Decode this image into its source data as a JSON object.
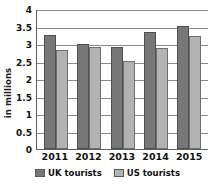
{
  "chart_data": {
    "type": "bar",
    "title": "",
    "subtitle": "",
    "xlabel": "",
    "ylabel": "in millions",
    "categories": [
      "2011",
      "2012",
      "2013",
      "2014",
      "2015"
    ],
    "series": [
      {
        "name": "UK tourists",
        "color": "#777777",
        "values": [
          3.26,
          3.0,
          2.92,
          3.33,
          3.52
        ]
      },
      {
        "name": "US tourists",
        "color": "#b3b3b3",
        "values": [
          2.83,
          2.92,
          2.51,
          2.89,
          3.22
        ]
      }
    ],
    "ylim": [
      0,
      4
    ],
    "ytick_labels": [
      "4",
      "3.5",
      "3",
      "2.5",
      "2",
      "1.5",
      "1",
      "0.5",
      "0"
    ],
    "ytick_values": [
      4,
      3.5,
      3,
      2.5,
      2,
      1.5,
      1,
      0.5,
      0
    ],
    "grid": true,
    "grid_axis": "y",
    "legend_position": "bottom",
    "legend": [
      "UK tourists",
      "US tourists"
    ]
  }
}
